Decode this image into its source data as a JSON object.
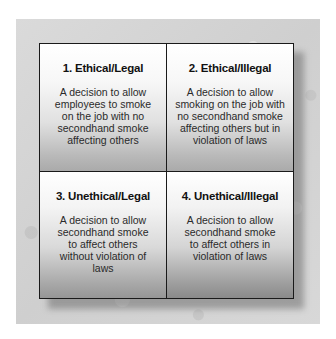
{
  "diagram": {
    "type": "2x2 matrix",
    "colors": {
      "background_panel": "#d4d4d4",
      "border": "#1a1a1a",
      "cell_top": "#ffffff",
      "cell_bottom": "#aaaaaa",
      "text": "#1c1c1c"
    },
    "quadrants": [
      {
        "title": "1. Ethical/Legal",
        "description": "A decision to allow employees to smoke on the job with no secondhand smoke affecting others"
      },
      {
        "title": "2. Ethical/Illegal",
        "description": "A decision to allow smoking on the job with no secondhand smoke affecting others but in violation of laws"
      },
      {
        "title": "3. Unethical/Legal",
        "description": "A decision to allow secondhand smoke to affect others without violation of laws"
      },
      {
        "title": "4. Unethical/Illegal",
        "description": "A decision to allow secondhand smoke to affect others in violation of laws"
      }
    ]
  }
}
